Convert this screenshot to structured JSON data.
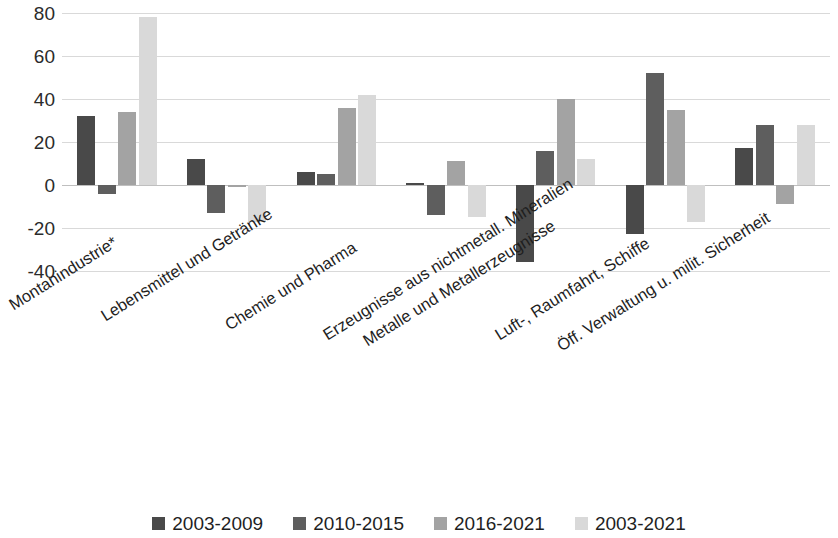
{
  "chart_data": {
    "type": "bar",
    "title": "",
    "subtitle": "",
    "xlabel": "",
    "ylabel": "",
    "ylim": [
      -40,
      80
    ],
    "ytick_labels": [
      "80",
      "60",
      "40",
      "20",
      "0",
      "-20",
      "-40"
    ],
    "ytick_values": [
      80,
      60,
      40,
      20,
      0,
      -20,
      -40
    ],
    "grid": true,
    "legend_position": "bottom",
    "categories": [
      "Montanindustrie*",
      "Lebensmittel und Getränke",
      "Chemie und Pharma",
      "Erzeugnisse aus nichtmetall. Mineralien",
      "Metalle und Metallerzeugnisse",
      "Luft-, Raumfahrt, Schiffe",
      "Öff. Verwaltung u. milit. Sicherheit"
    ],
    "series": [
      {
        "name": "2003-2009",
        "color": "#494949",
        "values": [
          32,
          12,
          6,
          1,
          -36,
          -23,
          17
        ]
      },
      {
        "name": "2010-2015",
        "color": "#5e5e5e",
        "values": [
          -4,
          -13,
          5,
          -14,
          16,
          52,
          28
        ]
      },
      {
        "name": "2016-2021",
        "color": "#a3a3a3",
        "values": [
          34,
          -1,
          36,
          11,
          40,
          35,
          -9
        ]
      },
      {
        "name": "2003-2021",
        "color": "#d9d9d9",
        "values": [
          78,
          -17,
          42,
          -15,
          12,
          -17,
          28
        ]
      }
    ]
  }
}
